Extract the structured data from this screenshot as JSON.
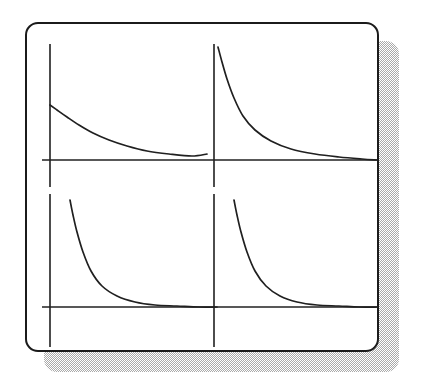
{
  "figure": {
    "background_color": "#ffffff",
    "card": {
      "fill_color": "#ffffff",
      "border_color": "#1b1b1b",
      "border_width_px": 2.5,
      "corner_radius_px": 13,
      "x": 25,
      "y": 22,
      "width": 350,
      "height": 326
    },
    "shadow": {
      "color": "#a9a9a9",
      "style": "dithered-halftone",
      "offset_x_px": 19,
      "offset_y_px": 19
    },
    "line_color": "#202020",
    "axis_line_width_px": 1.6,
    "curve_line_width_px": 1.7
  },
  "chart_data": {
    "type": "line",
    "subtitle": "",
    "xlabel": "",
    "ylabel": "",
    "grid": false,
    "legend": "none",
    "layout": "2x2 grid of coordinate-axis panels",
    "panel_count": 4,
    "panels": [
      {
        "name": "top-left",
        "position": "row 1, column 1",
        "axes": {
          "vertical_axis_x": 23,
          "vertical_axis_y_range": [
            20,
            163
          ],
          "horizontal_axis_y": 136,
          "horizontal_axis_x_range": [
            15,
            190
          ]
        },
        "curve": {
          "shape": "gentle hyperbolic decay",
          "description": "slow decreasing curve approaching the x-axis asymptotically",
          "x": [
            23,
            30,
            40,
            52,
            66,
            82,
            100,
            120,
            142,
            165,
            180
          ],
          "y": [
            81,
            86,
            93,
            101,
            109,
            116,
            122,
            127,
            130,
            132,
            130
          ]
        },
        "ylim": [
          0,
          145
        ],
        "xlim": [
          0,
          190
        ]
      },
      {
        "name": "top-right",
        "position": "row 1, column 2",
        "axes": {
          "vertical_axis_x": 187,
          "vertical_axis_y_range": [
            20,
            163
          ],
          "horizontal_axis_y": 136,
          "horizontal_axis_x_range": [
            15,
            350
          ]
        },
        "curve": {
          "shape": "steep hyperbolic decay",
          "description": "sharply falling curve from near the vertical axis flattening onto the x-axis",
          "x": [
            191,
            195,
            200,
            207,
            216,
            228,
            244,
            264,
            288,
            312,
            335,
            350
          ],
          "y": [
            23,
            38,
            55,
            74,
            92,
            106,
            117,
            125,
            130,
            133,
            135,
            136
          ]
        },
        "ylim": [
          0,
          145
        ],
        "xlim": [
          190,
          350
        ]
      },
      {
        "name": "bottom-left",
        "position": "row 2, column 1",
        "axes": {
          "vertical_axis_x": 23,
          "vertical_axis_y_range": [
            170,
            323
          ],
          "horizontal_axis_y": 283,
          "horizontal_axis_x_range": [
            15,
            190
          ]
        },
        "curve": {
          "shape": "very steep hyperbolic decay",
          "description": "rapidly falling curve flattening to a near-flat asymptote on the x-axis",
          "x": [
            43,
            46,
            50,
            56,
            64,
            75,
            90,
            108,
            128,
            150,
            172,
            190
          ],
          "y": [
            176,
            191,
            208,
            228,
            247,
            262,
            272,
            278,
            281,
            282,
            283,
            283
          ]
        },
        "ylim": [
          0,
          145
        ],
        "xlim": [
          0,
          190
        ]
      },
      {
        "name": "bottom-right",
        "position": "row 2, column 2",
        "axes": {
          "vertical_axis_x": 187,
          "vertical_axis_y_range": [
            170,
            323
          ],
          "horizontal_axis_y": 283,
          "horizontal_axis_x_range": [
            15,
            350
          ]
        },
        "curve": {
          "shape": "very steep hyperbolic decay",
          "description": "rapidly falling curve flattening to a near-flat asymptote on the x-axis",
          "x": [
            207,
            210,
            214,
            220,
            228,
            239,
            253,
            270,
            290,
            312,
            332,
            350
          ],
          "y": [
            176,
            191,
            208,
            228,
            247,
            262,
            272,
            278,
            281,
            282,
            283,
            283
          ]
        },
        "ylim": [
          0,
          145
        ],
        "xlim": [
          190,
          350
        ]
      }
    ]
  }
}
